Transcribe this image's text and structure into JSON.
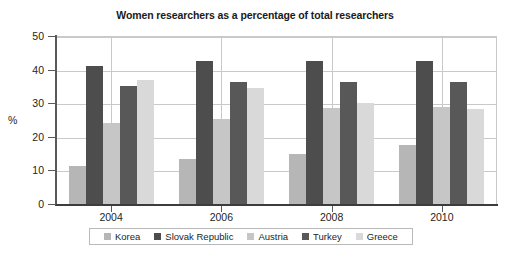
{
  "chart_data": {
    "type": "bar",
    "title": "Women researchers as a percentage of total researchers",
    "xlabel": "",
    "ylabel": "%",
    "categories": [
      "2004",
      "2006",
      "2008",
      "2010"
    ],
    "ylim": [
      0,
      50
    ],
    "yticks": [
      "0",
      "10",
      "20",
      "30",
      "40",
      "50"
    ],
    "grid": true,
    "legend_position": "bottom",
    "series": [
      {
        "name": "Korea",
        "color": "#b6b6b6",
        "values": [
          11.2,
          13.3,
          15.0,
          17.5
        ]
      },
      {
        "name": "Slovak Republic",
        "color": "#4d4d4d",
        "values": [
          41.2,
          42.5,
          42.5,
          42.5
        ]
      },
      {
        "name": "Austria",
        "color": "#c6c6c6",
        "values": [
          24.2,
          25.3,
          28.6,
          28.8
        ]
      },
      {
        "name": "Turkey",
        "color": "#585858",
        "values": [
          35.2,
          36.2,
          36.3,
          36.2
        ]
      },
      {
        "name": "Greece",
        "color": "#d9d9d9",
        "values": [
          37.0,
          34.6,
          30.2,
          28.4
        ]
      }
    ]
  },
  "axis": {
    "y_title": "%"
  }
}
